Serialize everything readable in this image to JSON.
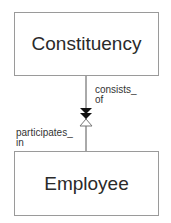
{
  "diagram": {
    "type": "entity-relationship",
    "entities": [
      {
        "id": "constituency",
        "name": "Constituency"
      },
      {
        "id": "employee",
        "name": "Employee"
      }
    ],
    "relationship": {
      "from": "Constituency",
      "to": "Employee",
      "from_label_line1": "consists_",
      "from_label_line2": "of",
      "to_label_line1": "participates_",
      "to_label_line2": "in",
      "from_end": "many (double filled arrow)",
      "to_end": "open triangle"
    },
    "colors": {
      "line": "#555555",
      "border": "#9a9a9a",
      "arrow_fill": "#111111"
    }
  }
}
